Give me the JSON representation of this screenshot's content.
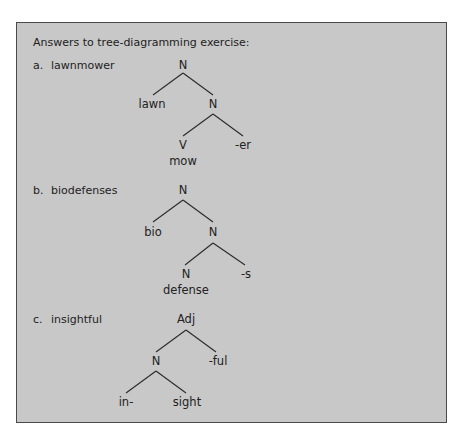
{
  "title": "Answers to tree-diagramming exercise:",
  "items": [
    {
      "marker": "a.",
      "word": "lawnmower",
      "tree": {
        "root": "N",
        "left_leaf": "lawn",
        "right_node": "N",
        "inner_left": "V",
        "inner_left_gloss": "mow",
        "inner_right": "-er"
      }
    },
    {
      "marker": "b.",
      "word": "biodefenses",
      "tree": {
        "root": "N",
        "left_leaf": "bio",
        "right_node": "N",
        "inner_left": "N",
        "inner_left_gloss": "defense",
        "inner_right": "-s"
      }
    },
    {
      "marker": "c.",
      "word": "insightful",
      "tree": {
        "root": "Adj",
        "left_node": "N",
        "right_leaf": "-ful",
        "inner_left": "in-",
        "inner_right": "sight"
      }
    }
  ]
}
